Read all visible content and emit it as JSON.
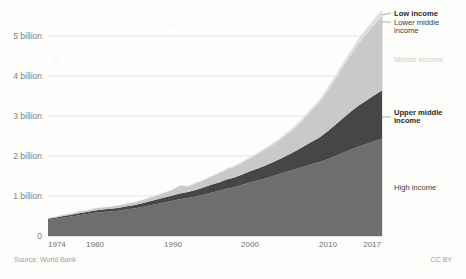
{
  "chart_data": {
    "type": "area",
    "stacked": true,
    "title": "",
    "subtitle": "",
    "xlabel": "",
    "ylabel": "",
    "xlim": [
      1974,
      2017
    ],
    "ylim": [
      0,
      5400000000
    ],
    "grid": true,
    "legend_position": "right-inline",
    "y_tick_labels": [
      "0",
      "1 billion",
      "2 billion",
      "3 billion",
      "4 billion",
      "5 billion"
    ],
    "y_tick_values": [
      0,
      1000000000,
      2000000000,
      3000000000,
      4000000000,
      5000000000
    ],
    "x_tick_labels": [
      "1974",
      "1980",
      "1990",
      "2000",
      "2010",
      "2017"
    ],
    "x_tick_values": [
      1974,
      1980,
      1990,
      2000,
      2010,
      2017
    ],
    "x": [
      1974,
      1975,
      1976,
      1977,
      1978,
      1979,
      1980,
      1981,
      1982,
      1983,
      1984,
      1985,
      1986,
      1987,
      1988,
      1989,
      1990,
      1991,
      1992,
      1993,
      1994,
      1995,
      1996,
      1997,
      1998,
      1999,
      2000,
      2001,
      2002,
      2003,
      2004,
      2005,
      2006,
      2007,
      2008,
      2009,
      2010,
      2011,
      2012,
      2013,
      2014,
      2015,
      2016,
      2017
    ],
    "series": [
      {
        "name": "High income",
        "color": "#6e6e6e",
        "values": [
          0.4,
          0.43,
          0.46,
          0.49,
          0.52,
          0.55,
          0.58,
          0.6,
          0.61,
          0.63,
          0.66,
          0.69,
          0.72,
          0.76,
          0.8,
          0.84,
          0.88,
          0.92,
          0.95,
          0.99,
          1.03,
          1.08,
          1.13,
          1.18,
          1.22,
          1.28,
          1.34,
          1.39,
          1.44,
          1.5,
          1.56,
          1.62,
          1.68,
          1.74,
          1.8,
          1.85,
          1.92,
          2.0,
          2.08,
          2.16,
          2.24,
          2.3,
          2.37,
          2.44
        ]
      },
      {
        "name": "Upper middle income",
        "color": "#464646",
        "values": [
          0.03,
          0.03,
          0.04,
          0.04,
          0.05,
          0.05,
          0.06,
          0.06,
          0.07,
          0.07,
          0.08,
          0.08,
          0.09,
          0.1,
          0.11,
          0.12,
          0.13,
          0.14,
          0.15,
          0.16,
          0.18,
          0.2,
          0.21,
          0.23,
          0.24,
          0.26,
          0.28,
          0.3,
          0.32,
          0.35,
          0.38,
          0.42,
          0.46,
          0.51,
          0.56,
          0.62,
          0.7,
          0.78,
          0.87,
          0.95,
          1.02,
          1.09,
          1.15,
          1.2
        ]
      },
      {
        "name": "Lower middle income",
        "color": "#c9c9c7",
        "values": [
          0.02,
          0.02,
          0.03,
          0.03,
          0.04,
          0.04,
          0.05,
          0.05,
          0.05,
          0.06,
          0.06,
          0.07,
          0.08,
          0.09,
          0.1,
          0.12,
          0.14,
          0.2,
          0.14,
          0.16,
          0.18,
          0.2,
          0.22,
          0.25,
          0.27,
          0.29,
          0.32,
          0.36,
          0.4,
          0.44,
          0.48,
          0.53,
          0.6,
          0.68,
          0.78,
          0.88,
          1.0,
          1.14,
          1.28,
          1.42,
          1.55,
          1.66,
          1.76,
          1.84
        ]
      },
      {
        "name": "Low income",
        "color": "#dedede",
        "values": [
          0.005,
          0.005,
          0.006,
          0.006,
          0.007,
          0.007,
          0.008,
          0.008,
          0.009,
          0.009,
          0.01,
          0.01,
          0.011,
          0.012,
          0.013,
          0.014,
          0.015,
          0.016,
          0.017,
          0.019,
          0.021,
          0.023,
          0.025,
          0.027,
          0.029,
          0.031,
          0.034,
          0.037,
          0.04,
          0.044,
          0.048,
          0.053,
          0.058,
          0.064,
          0.07,
          0.077,
          0.085,
          0.094,
          0.104,
          0.115,
          0.127,
          0.14,
          0.155,
          0.17
        ]
      }
    ],
    "value_unit": "billions",
    "annotations": [
      {
        "id": "low-income",
        "label": "Low income",
        "style": "dark"
      },
      {
        "id": "lower-middle-income",
        "label": "Lower middle\nincome",
        "style": "normal"
      },
      {
        "id": "middle-income",
        "label": "Middle income",
        "style": "faint"
      },
      {
        "id": "upper-middle-income",
        "label": "Upper middle\nincome",
        "style": "dark"
      },
      {
        "id": "high-income",
        "label": "High income",
        "style": "normal"
      }
    ]
  },
  "labels": {
    "low_income": "Low income",
    "lower_middle_income_line1": "Lower middle",
    "lower_middle_income_line2": "income",
    "middle_income": "Middle income",
    "upper_middle_income_line1": "Upper middle",
    "upper_middle_income_line2": "income",
    "high_income": "High income"
  },
  "axis": {
    "y": [
      "5 billion",
      "4 billion",
      "3 billion",
      "2 billion",
      "1 billion",
      "0"
    ],
    "x": [
      "1974",
      "1980",
      "1990",
      "2000",
      "2010",
      "2017"
    ]
  },
  "footer": {
    "source": "Source: World Bank",
    "license": "CC BY"
  }
}
